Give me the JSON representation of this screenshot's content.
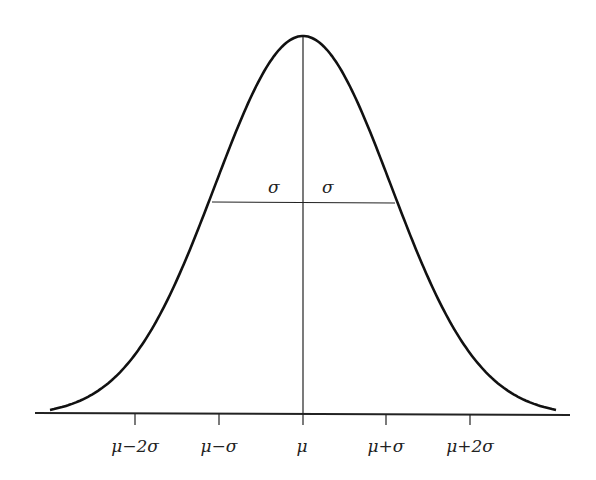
{
  "diagram": {
    "title": "",
    "type": "normal-distribution",
    "mean_label": "μ",
    "sigma_labels": [
      "σ",
      "σ"
    ],
    "axis_ticks": [
      {
        "label": "μ−2σ",
        "x": 135
      },
      {
        "label": "μ−σ",
        "x": 219
      },
      {
        "label": "μ",
        "x": 302
      },
      {
        "label": "μ+σ",
        "x": 386
      },
      {
        "label": "μ+2σ",
        "x": 470
      }
    ],
    "colors": {
      "line": "#111111",
      "background": "#ffffff"
    }
  },
  "chart_data": {
    "type": "line",
    "xlabel": "",
    "ylabel": "",
    "categories": [
      "μ−2σ",
      "μ−σ",
      "μ",
      "μ+σ",
      "μ+2σ"
    ],
    "series": [
      {
        "name": "density (relative)",
        "values": [
          0.135,
          0.607,
          1.0,
          0.607,
          0.135
        ]
      }
    ],
    "annotations": [
      "σ width marked left and right of μ at inflection height"
    ],
    "grid": false
  }
}
